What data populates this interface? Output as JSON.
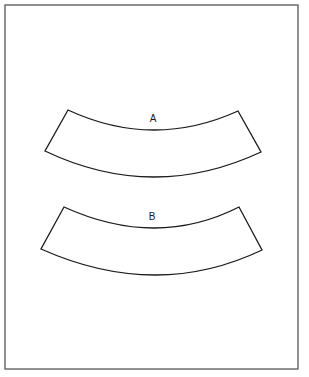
{
  "figure": {
    "frame": {
      "x": 5,
      "y": 5,
      "width": 293,
      "height": 364,
      "stroke": "#555555"
    },
    "stroke_color": "#1a1a1a",
    "shapes": [
      {
        "label": "A",
        "label_pos": {
          "x": 153,
          "y": 122
        },
        "top_left": [
          68,
          110
        ],
        "top_right": [
          238,
          111
        ],
        "top_arc_mid": [
          153,
          130
        ],
        "bottom_left": [
          45,
          151
        ],
        "bottom_right": [
          261,
          152
        ],
        "bottom_arc_mid": [
          153,
          177
        ]
      },
      {
        "label": "B",
        "label_pos": {
          "x": 152,
          "y": 220
        },
        "top_left": [
          64,
          207
        ],
        "top_right": [
          239,
          207
        ],
        "top_arc_mid": [
          154,
          228
        ],
        "bottom_left": [
          41,
          249
        ],
        "bottom_right": [
          262,
          250
        ],
        "bottom_arc_mid": [
          154,
          275
        ]
      }
    ]
  }
}
